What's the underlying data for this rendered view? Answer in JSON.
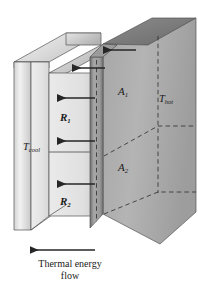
{
  "figure": {
    "kind": "thermal-resistance-composite-wall-diagram",
    "labels": {
      "area_1": "A",
      "area_1_sub": "1",
      "area_2": "A",
      "area_2_sub": "2",
      "t_hot": "T",
      "t_hot_sub": "hot",
      "t_cool": "T",
      "t_cool_sub": "cool",
      "resistance_1": "R",
      "resistance_1_sub": "1",
      "resistance_2": "R",
      "resistance_2_sub": "2"
    },
    "caption": {
      "line_1": "Thermal energy",
      "line_2": "flow"
    },
    "colors": {
      "ink": "#1a1a1a",
      "background": "#ffffff",
      "slab_light": "#e8e8e8",
      "slab_mid": "#b9b9b9",
      "slab_dark": "#8f8f8f",
      "slab_darker": "#6f6f6f",
      "edge_line": "#4a4a4a",
      "dashed_line": "#2b2b2b",
      "arrow": "#262626"
    },
    "arrows": {
      "flow_direction": "left",
      "heat_flow_arrow_count": 3,
      "thickness_arrow_count": 2,
      "caption_arrow_direction": "left"
    }
  }
}
